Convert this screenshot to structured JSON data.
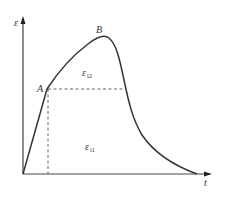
{
  "diagram": {
    "type": "strain-time curve",
    "axes": {
      "y_label": "ε",
      "x_label": "t"
    },
    "points": {
      "A": {
        "label": "A"
      },
      "B": {
        "label": "B"
      }
    },
    "regions": {
      "upper": {
        "symbol": "ε",
        "subscript": "i2"
      },
      "lower": {
        "symbol": "ε",
        "subscript": "i1"
      }
    },
    "colors": {
      "stroke": "#333333",
      "dashed": "#555555",
      "background": "#ffffff"
    }
  }
}
